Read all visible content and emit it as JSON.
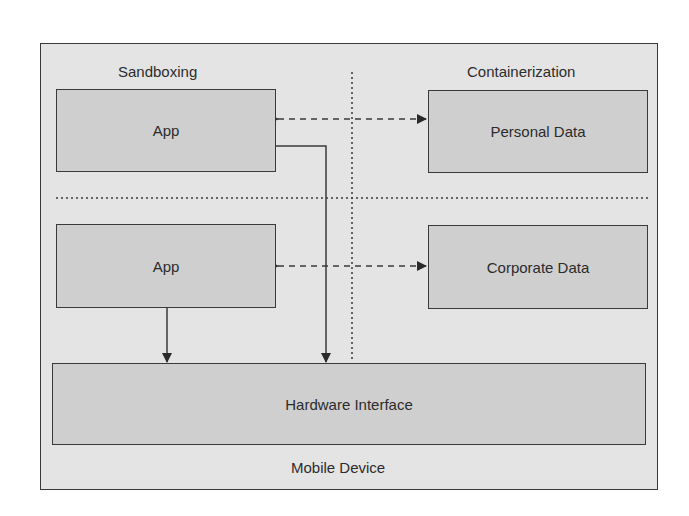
{
  "diagram": {
    "container_label": "Mobile Device",
    "section_labels": {
      "left": "Sandboxing",
      "right": "Containerization"
    },
    "boxes": {
      "app_top": "App",
      "personal_data": "Personal Data",
      "app_bottom": "App",
      "corporate_data": "Corporate Data",
      "hardware_interface": "Hardware Interface"
    },
    "connections": [
      {
        "from": "App",
        "to": "Personal Data",
        "style": "dashed",
        "direction": "bidirectional"
      },
      {
        "from": "App",
        "to": "Corporate Data",
        "style": "dashed",
        "direction": "bidirectional"
      },
      {
        "from": "App (top)",
        "to": "Hardware Interface",
        "style": "solid",
        "direction": "forward"
      },
      {
        "from": "App (bottom)",
        "to": "Hardware Interface",
        "style": "solid",
        "direction": "forward"
      }
    ],
    "separators": [
      "vertical-dotted",
      "horizontal-dotted"
    ],
    "colors": {
      "frame_bg": "#e4e4e4",
      "box_bg": "#cfcfcf",
      "stroke": "#3a3a3a"
    }
  }
}
